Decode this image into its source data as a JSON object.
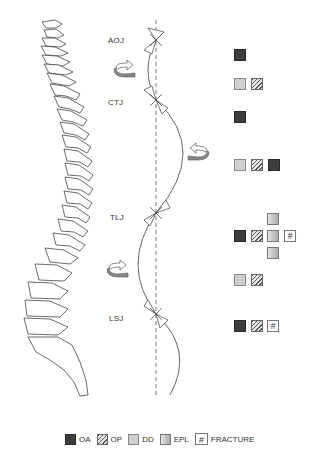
{
  "diagram": {
    "junctions": [
      {
        "id": "aoj",
        "label": "AOJ",
        "y": 40
      },
      {
        "id": "ctj",
        "label": "CTJ",
        "y": 101
      },
      {
        "id": "tlj",
        "label": "TLJ",
        "y": 213
      },
      {
        "id": "lsj",
        "label": "LSJ",
        "y": 314
      }
    ],
    "rotation_arrows": [
      {
        "position": "upper-left",
        "direction": "clockwise"
      },
      {
        "position": "mid-right",
        "direction": "counter-clockwise"
      },
      {
        "position": "lower-left",
        "direction": "clockwise"
      }
    ],
    "pathology_groups": [
      {
        "region": "AOJ",
        "items": [
          "OA"
        ]
      },
      {
        "region": "upper-cervical",
        "items": [
          "DD",
          "OP"
        ]
      },
      {
        "region": "CTJ",
        "items": [
          "OA"
        ]
      },
      {
        "region": "thoracic",
        "items": [
          "DD",
          "OP",
          "OA"
        ]
      },
      {
        "region": "TLJ",
        "items": [
          "OA",
          "OP",
          "EPL",
          "FRACTURE"
        ],
        "epl_stack": 3
      },
      {
        "region": "lumbar",
        "items": [
          "DD",
          "OP"
        ]
      },
      {
        "region": "LSJ",
        "items": [
          "OA",
          "OP",
          "FRACTURE"
        ]
      }
    ]
  },
  "legend": {
    "items": [
      {
        "key": "oa",
        "label": "OA"
      },
      {
        "key": "op",
        "label": "OP"
      },
      {
        "key": "dd",
        "label": "DD"
      },
      {
        "key": "epl",
        "label": "EPL"
      },
      {
        "key": "fracture",
        "label": "FRACTURE",
        "symbol": "#"
      }
    ]
  },
  "colors": {
    "oa": "#3d3d3d",
    "dd": "#cfcfcf",
    "line": "#555555",
    "arrow_fill": "#888888"
  }
}
